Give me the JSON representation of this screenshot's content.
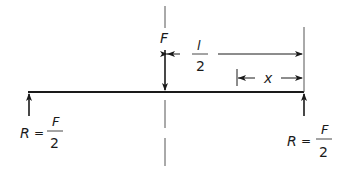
{
  "diagram": {
    "type": "simply-supported-beam-center-load",
    "colors": {
      "ink": "#1a1a1a",
      "background": "#ffffff"
    },
    "load": {
      "label": "F"
    },
    "dimensions": {
      "half_span": {
        "numerator": "l",
        "denominator": "2"
      },
      "distance": {
        "label": "x"
      }
    },
    "reactions": {
      "left": {
        "symbol": "R",
        "equals": "=",
        "numerator": "F",
        "denominator": "2"
      },
      "right": {
        "symbol": "R",
        "equals": "=",
        "numerator": "F",
        "denominator": "2"
      }
    }
  }
}
